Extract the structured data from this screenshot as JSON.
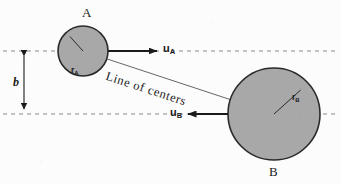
{
  "figure": {
    "type": "physics-collision-diagram",
    "background_color": "#fcfcfc",
    "ink_color": "#1a1a1a",
    "sphere_fill": "#a8a8a8",
    "sphere_stroke": "#2a2a2a",
    "dashed_color": "#8a8a8a"
  },
  "bodies": [
    {
      "key": "A",
      "label": "A",
      "label_x": 82,
      "label_y": 6,
      "cx": 83,
      "cy": 51,
      "r": 25,
      "radius_label": "r",
      "radius_sub": "A",
      "radius_label_x": 71,
      "radius_label_y": 66,
      "radius_angle_deg": 228
    },
    {
      "key": "B",
      "label": "B",
      "label_x": 269,
      "label_y": 165,
      "cx": 274,
      "cy": 114,
      "r": 46,
      "radius_label": "r",
      "radius_sub": "B",
      "radius_label_x": 292,
      "radius_label_y": 93,
      "radius_angle_deg": 318
    }
  ],
  "vectors": [
    {
      "key": "uA",
      "label": "u",
      "sub": "A",
      "label_x": 163,
      "label_y": 43,
      "x1": 108,
      "y1": 51,
      "x2": 157,
      "y2": 51,
      "direction": "right"
    },
    {
      "key": "uB",
      "label": "u",
      "sub": "B",
      "label_x": 170,
      "label_y": 107,
      "x1": 228,
      "y1": 114,
      "x2": 188,
      "y2": 114,
      "direction": "left"
    }
  ],
  "dashed_lines": [
    {
      "key": "upper-trajectory",
      "y": 51,
      "x1": 3,
      "x2": 338
    },
    {
      "key": "lower-trajectory",
      "y": 114,
      "x1": 3,
      "x2": 338
    }
  ],
  "impact_parameter": {
    "label": "b",
    "label_x": 13,
    "label_y": 76,
    "x": 24,
    "y_top": 51,
    "y_bottom": 114
  },
  "line_of_centers": {
    "label": "Line of centers",
    "x1": 83,
    "y1": 51,
    "x2": 274,
    "y2": 114,
    "text_x": 108,
    "text_y": 70,
    "rotation_deg": 18
  }
}
